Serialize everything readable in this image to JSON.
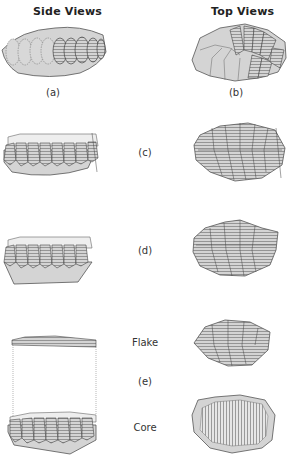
{
  "headers": {
    "left": "Side Views",
    "right": "Top Views"
  },
  "labels": {
    "a": "(a)",
    "b": "(b)",
    "c": "(c)",
    "d": "(d)",
    "e": "(e)",
    "flake": "Flake",
    "core": "Core"
  },
  "colors": {
    "fill": "#d4d4d4",
    "stroke": "#555555",
    "hatch": "#777777",
    "background": "#ffffff"
  }
}
